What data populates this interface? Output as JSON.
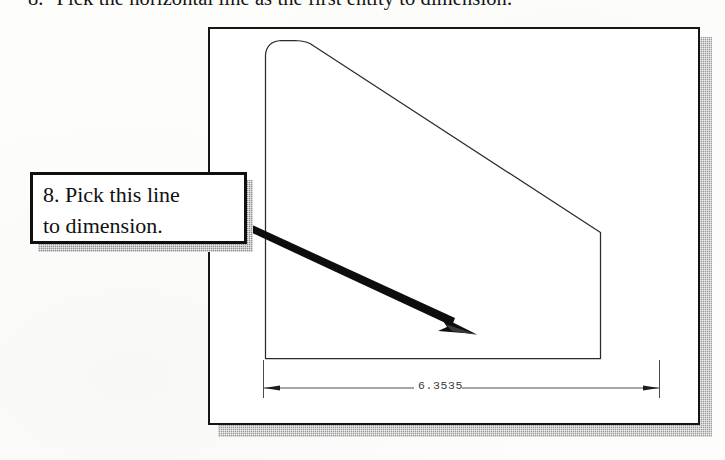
{
  "figure": {
    "kind": "cad-tutorial-figure",
    "heading": {
      "step_number": "8.",
      "text": "Pick the horizontal line as the first entity to dimension."
    },
    "callout": {
      "line1": "8. Pick this line",
      "line2": "to dimension.",
      "border_color": "#101010",
      "fill_color": "#ffffff",
      "shadow_color": "#8f8f8f"
    },
    "cad_window": {
      "border_color": "#151515",
      "fill_color": "#ffffff",
      "shadow_color": "#9a9a9a"
    },
    "drawing": {
      "line_color": "#2b2b2b",
      "description": "profile with rounded top-left corner, sloped top-right edge, vertical right edge and horizontal bottom edge"
    },
    "dimension": {
      "value": "6.3535",
      "line_color": "#454545",
      "text_color": "#3c3c3c"
    },
    "pointer_arrow": {
      "color": "#0d0d0d"
    }
  }
}
